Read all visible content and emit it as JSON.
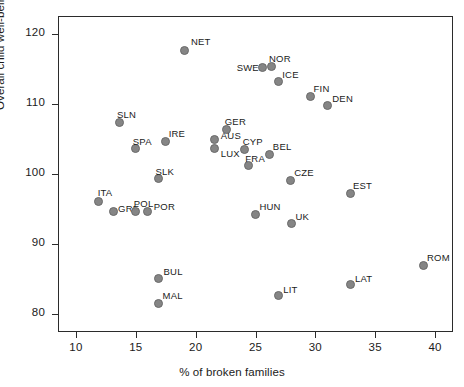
{
  "chart_data": {
    "type": "scatter",
    "title": "",
    "xlabel": "% of broken families",
    "ylabel": "Overall child well-being",
    "xlim": [
      8.5,
      41.5
    ],
    "ylim": [
      77.5,
      122.5
    ],
    "xticks": [
      10,
      15,
      20,
      25,
      30,
      35,
      40
    ],
    "yticks": [
      80,
      90,
      100,
      110,
      120
    ],
    "grid": false,
    "legend": null,
    "marker_color": "#858585",
    "marker_edge_color": "#6a6a6a",
    "axis_color": "#2b2b2b",
    "points": [
      {
        "label": "NET",
        "x": 19.1,
        "y": 117.6,
        "lx": 6,
        "ly": -14
      },
      {
        "label": "SWE",
        "x": 25.6,
        "y": 115.2,
        "lx": -26,
        "ly": -5
      },
      {
        "label": "NOR",
        "x": 26.3,
        "y": 115.3,
        "lx": -2,
        "ly": -14
      },
      {
        "label": "ICE",
        "x": 26.9,
        "y": 113.2,
        "lx": 4,
        "ly": -12
      },
      {
        "label": "FIN",
        "x": 29.6,
        "y": 111.1,
        "lx": 3,
        "ly": -13
      },
      {
        "label": "DEN",
        "x": 31.0,
        "y": 109.7,
        "lx": 5,
        "ly": -13
      },
      {
        "label": "SLN",
        "x": 13.6,
        "y": 107.3,
        "lx": -2,
        "ly": -14
      },
      {
        "label": "SPA",
        "x": 15.0,
        "y": 103.6,
        "lx": -3,
        "ly": -13
      },
      {
        "label": "IRE",
        "x": 17.5,
        "y": 104.6,
        "lx": 3,
        "ly": -14
      },
      {
        "label": "GER",
        "x": 22.6,
        "y": 106.3,
        "lx": -2,
        "ly": -14
      },
      {
        "label": "AUS",
        "x": 21.6,
        "y": 104.9,
        "lx": 6,
        "ly": -10
      },
      {
        "label": "LUX",
        "x": 21.6,
        "y": 103.6,
        "lx": 6,
        "ly": -1
      },
      {
        "label": "CYP",
        "x": 24.1,
        "y": 103.5,
        "lx": -2,
        "ly": -13
      },
      {
        "label": "BEL",
        "x": 26.2,
        "y": 102.8,
        "lx": 3,
        "ly": -13
      },
      {
        "label": "FRA",
        "x": 24.4,
        "y": 101.2,
        "lx": -3,
        "ly": -13
      },
      {
        "label": "SLK",
        "x": 16.9,
        "y": 99.3,
        "lx": -3,
        "ly": -13
      },
      {
        "label": "CZE",
        "x": 27.9,
        "y": 99.1,
        "lx": 4,
        "ly": -13
      },
      {
        "label": "EST",
        "x": 32.9,
        "y": 97.2,
        "lx": 3,
        "ly": -14
      },
      {
        "label": "ITA",
        "x": 11.9,
        "y": 96.1,
        "lx": -1,
        "ly": -14
      },
      {
        "label": "GRE",
        "x": 13.1,
        "y": 94.6,
        "lx": 5,
        "ly": -9
      },
      {
        "label": "POL",
        "x": 15.0,
        "y": 94.7,
        "lx": -2,
        "ly": -13
      },
      {
        "label": "POR",
        "x": 16.0,
        "y": 94.7,
        "lx": 6,
        "ly": -10
      },
      {
        "label": "HUN",
        "x": 25.0,
        "y": 94.3,
        "lx": 4,
        "ly": -13
      },
      {
        "label": "UK",
        "x": 28.0,
        "y": 92.9,
        "lx": 4,
        "ly": -13
      },
      {
        "label": "BUL",
        "x": 16.9,
        "y": 85.1,
        "lx": 5,
        "ly": -13
      },
      {
        "label": "MAL",
        "x": 16.9,
        "y": 81.6,
        "lx": 4,
        "ly": -13
      },
      {
        "label": "LIT",
        "x": 26.9,
        "y": 82.7,
        "lx": 5,
        "ly": -11
      },
      {
        "label": "LAT",
        "x": 32.9,
        "y": 84.2,
        "lx": 5,
        "ly": -12
      },
      {
        "label": "ROM",
        "x": 39.0,
        "y": 87.0,
        "lx": 4,
        "ly": -13
      }
    ]
  }
}
